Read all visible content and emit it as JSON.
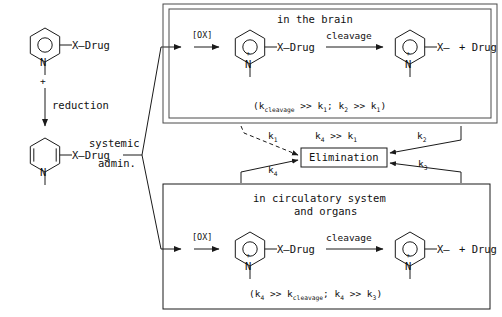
{
  "diagram": {
    "title_implicit": "Chemical delivery system scheme",
    "line_color": "#1a1a1a",
    "background": "#ffffff"
  },
  "left_pathway": {
    "structure_top": {
      "name": "pyridinium-salt",
      "ring_type": "aromatic",
      "charge_label": "+",
      "nitrogen_label": "N",
      "substituent": "X—Drug",
      "n_substituent": "methyl"
    },
    "reduction_arrow_label": "reduction",
    "structure_bottom": {
      "name": "dihydropyridine",
      "ring_type": "dihydro",
      "nitrogen_label": "N",
      "substituent": "X—Drug",
      "n_substituent": "methyl"
    },
    "admin_label_line1": "systemic",
    "admin_label_line2": "admin."
  },
  "brain_box": {
    "title": "in the brain",
    "oxidation_label": "[OX]",
    "cleavage_label": "cleavage",
    "reactant": {
      "name": "dihydropyridine-in-brain",
      "charge_label": "+",
      "nitrogen_label": "N",
      "substituent": "X—Drug"
    },
    "product": {
      "name": "pyridinium-conjugate",
      "charge_label": "+",
      "nitrogen_label": "N",
      "substituent": "X—",
      "released": "+ Drug"
    },
    "kinetics_note": "(kcleavage >> k1;  k2 >> k1)",
    "kinetics_parts": {
      "open": "(k",
      "sub1": "cleavage",
      "mid1": " >> k",
      "sub2": "1",
      "mid2": ";  k",
      "sub3": "2",
      "mid3": " >> k",
      "sub4": "1",
      "close": ")"
    }
  },
  "circulatory_box": {
    "title_line1": "in circulatory system",
    "title_line2": "and organs",
    "oxidation_label": "[OX]",
    "cleavage_label": "cleavage",
    "reactant": {
      "name": "dihydropyridine-in-periphery",
      "charge_label": "+",
      "nitrogen_label": "N",
      "substituent": "X—Drug"
    },
    "product": {
      "name": "pyridinium-conjugate",
      "charge_label": "+",
      "nitrogen_label": "N",
      "substituent": "X—",
      "released": "+ Drug"
    },
    "kinetics_note": "(k4 >> kcleavage;  k4 >> k3)",
    "kinetics_parts": {
      "open": "(k",
      "sub1": "4",
      "mid1": " >> k",
      "sub2": "cleavage",
      "mid2": ";  k",
      "sub3": "4",
      "mid3": " >> k",
      "sub4": "3",
      "close": ")"
    }
  },
  "elimination": {
    "label": "Elimination",
    "comparison_parts": {
      "lead": "k",
      "sub_a": "4",
      "mid": " >> k",
      "sub_b": "1"
    },
    "rate_constants": {
      "k1": {
        "base": "k",
        "sub": "1"
      },
      "k2": {
        "base": "k",
        "sub": "2"
      },
      "k3": {
        "base": "k",
        "sub": "3"
      },
      "k4": {
        "base": "k",
        "sub": "4"
      }
    }
  }
}
